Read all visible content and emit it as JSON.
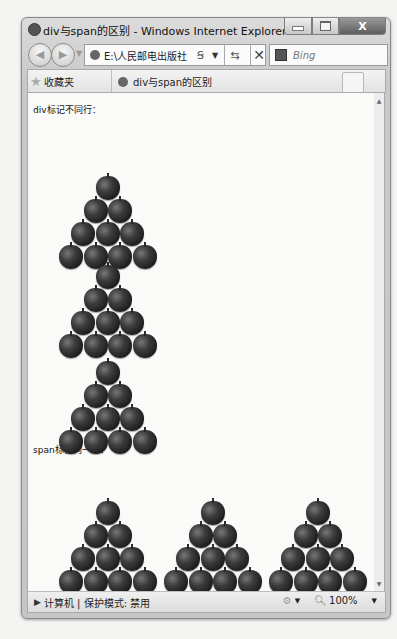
{
  "window": {
    "title": "div与span的区别 - Windows Internet Explorer",
    "controls": {
      "minimize": "minimize",
      "maximize": "maximize",
      "close": "X"
    }
  },
  "navbar": {
    "back_icon": "back-arrow-icon",
    "forward_icon": "forward-arrow-icon",
    "address_value": "E:\\人民邮电出版社",
    "compat_glyph": "Ꞩ",
    "dropdown_glyph": "▼",
    "refresh_glyph": "⇆",
    "stop_glyph": "✕",
    "search_placeholder": "Bing"
  },
  "tabbar": {
    "favorites_label": "收藏夹",
    "tabs": [
      {
        "label": "div与span的区别",
        "active": true
      }
    ]
  },
  "content": {
    "div_heading": "div标记不同行：",
    "span_heading": "span标记同一行：",
    "div_pyramids": [
      {
        "left": 31,
        "top": 83,
        "rows": [
          1,
          2,
          3,
          4
        ]
      },
      {
        "left": 31,
        "top": 172,
        "rows": [
          1,
          2,
          3,
          4
        ]
      },
      {
        "left": 31,
        "top": 268,
        "rows": [
          1,
          2,
          3,
          4
        ]
      }
    ],
    "span_pyramids": [
      {
        "left": 31,
        "top": 408,
        "rows": [
          1,
          2,
          3,
          4
        ]
      },
      {
        "left": 136,
        "top": 408,
        "rows": [
          1,
          2,
          3,
          4
        ]
      },
      {
        "left": 241,
        "top": 408,
        "rows": [
          1,
          2,
          3,
          4
        ]
      }
    ],
    "scroll_up": "▲",
    "scroll_down": "▼"
  },
  "statusbar": {
    "zone_icon": "computer-icon",
    "zone_text": "计算机 | 保护模式: 禁用",
    "zoom_level": "100%",
    "dropdown_glyph": "▼"
  }
}
